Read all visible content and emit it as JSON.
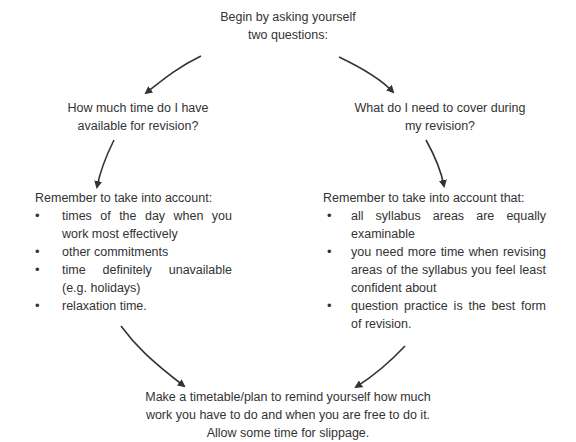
{
  "start": {
    "lines": [
      "Begin by asking yourself",
      "two questions:"
    ]
  },
  "question_left": {
    "lines": [
      "How much time do I have",
      "available for revision?"
    ]
  },
  "question_right": {
    "lines": [
      "What do I need to cover during",
      "my revision?"
    ]
  },
  "considerations_left": {
    "heading": "Remember to take into account:",
    "items": [
      "times of the day when you work most effectively",
      "other commitments",
      "time definitely unavailable (e.g. holidays)",
      "relaxation time."
    ]
  },
  "considerations_right": {
    "heading": "Remember to take into account that:",
    "items": [
      "all syllabus areas are equally examinable",
      "you need more time when revising areas of the syllabus you feel least confident about",
      "question practice is the best form of revision."
    ]
  },
  "outcome": {
    "lines": [
      "Make a timetable/plan to remind yourself how much",
      "work you have to do and when you are free to do it.",
      "Allow some time for slippage."
    ]
  },
  "bullet_glyph": "•",
  "colors": {
    "text": "#333333",
    "arrow": "#333333",
    "background": "#ffffff"
  }
}
